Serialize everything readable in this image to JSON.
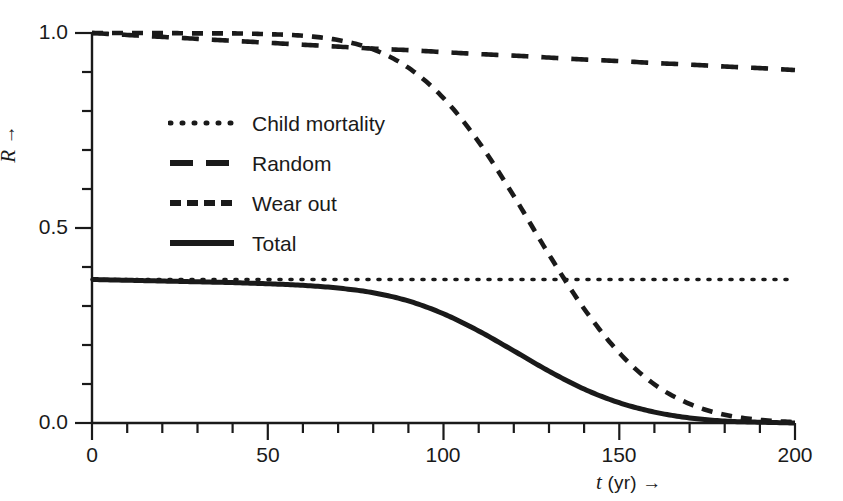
{
  "chart_data": {
    "type": "line",
    "title": "",
    "xlabel": "t (yr) →",
    "xlabel_parts": {
      "variable": "t",
      "unit": "(yr)",
      "arrow": "→"
    },
    "ylabel": "R →",
    "ylabel_parts": {
      "variable": "R",
      "arrow": "→"
    },
    "xlim": [
      0,
      200
    ],
    "ylim": [
      0.0,
      1.0
    ],
    "xticks": [
      0,
      50,
      100,
      150,
      200
    ],
    "xtick_labels": [
      "0",
      "50",
      "100",
      "150",
      "200"
    ],
    "xminor_step": 10,
    "yticks": [
      0.0,
      0.5,
      1.0
    ],
    "ytick_labels": [
      "0.0",
      "0.5",
      "1.0"
    ],
    "yminor_step": 0.1,
    "grid": false,
    "legend_position": "upper-left-inside",
    "spines": [
      "left",
      "bottom"
    ],
    "line_color": "#1a1a1a",
    "series": [
      {
        "name": "Child mortality",
        "style": "dotted",
        "dasharray": "2,9",
        "width": 3.6,
        "x": [
          0,
          5,
          10,
          20,
          30,
          40,
          50,
          60,
          70,
          80,
          90,
          100,
          110,
          120,
          130,
          140,
          150,
          160,
          170,
          180,
          190,
          200
        ],
        "values": [
          0.368,
          0.368,
          0.368,
          0.368,
          0.368,
          0.368,
          0.368,
          0.368,
          0.368,
          0.368,
          0.368,
          0.368,
          0.368,
          0.368,
          0.368,
          0.368,
          0.368,
          0.368,
          0.368,
          0.368,
          0.368,
          0.368
        ]
      },
      {
        "name": "Random",
        "style": "long-dash",
        "dasharray": "17,13",
        "width": 4.6,
        "x": [
          0,
          10,
          20,
          30,
          40,
          50,
          60,
          70,
          80,
          90,
          100,
          110,
          120,
          130,
          140,
          150,
          160,
          170,
          180,
          190,
          200
        ],
        "values": [
          1.0,
          0.995,
          0.99,
          0.985,
          0.98,
          0.975,
          0.97,
          0.965,
          0.96,
          0.956,
          0.951,
          0.946,
          0.942,
          0.937,
          0.932,
          0.928,
          0.923,
          0.919,
          0.914,
          0.91,
          0.905
        ]
      },
      {
        "name": "Wear out",
        "style": "medium-dash",
        "dasharray": "11,9",
        "width": 4.6,
        "x": [
          0,
          10,
          20,
          30,
          40,
          50,
          60,
          70,
          80,
          90,
          100,
          110,
          120,
          130,
          140,
          150,
          160,
          170,
          180,
          190,
          200
        ],
        "values": [
          1.0,
          1.0,
          1.0,
          0.999,
          0.999,
          0.997,
          0.993,
          0.982,
          0.958,
          0.911,
          0.833,
          0.721,
          0.582,
          0.432,
          0.293,
          0.18,
          0.099,
          0.049,
          0.021,
          0.008,
          0.002
        ]
      },
      {
        "name": "Total",
        "style": "solid",
        "dasharray": "none",
        "width": 5.0,
        "x": [
          0,
          10,
          20,
          30,
          40,
          50,
          60,
          70,
          80,
          90,
          100,
          110,
          120,
          130,
          140,
          150,
          160,
          170,
          180,
          190,
          200
        ],
        "values": [
          0.368,
          0.366,
          0.364,
          0.362,
          0.36,
          0.357,
          0.353,
          0.346,
          0.334,
          0.313,
          0.28,
          0.236,
          0.185,
          0.133,
          0.087,
          0.052,
          0.028,
          0.013,
          0.005,
          0.002,
          0.0
        ]
      }
    ],
    "annotations": [
      {
        "text": "Wear out crosses Child mortality",
        "x": 140,
        "y": 0.368
      }
    ]
  },
  "legend": {
    "entries": [
      {
        "label": "Child mortality",
        "style": "dotted"
      },
      {
        "label": "Random",
        "style": "long-dash"
      },
      {
        "label": "Wear out",
        "style": "medium-dash"
      },
      {
        "label": "Total",
        "style": "solid"
      }
    ]
  }
}
